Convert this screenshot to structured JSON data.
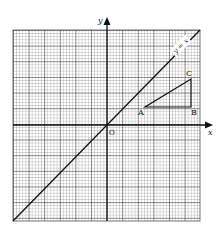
{
  "figure": {
    "axes": {
      "x_label": "x",
      "y_label": "y",
      "origin_label": "O"
    },
    "line": {
      "label": "y = x"
    },
    "triangle": {
      "points": [
        {
          "label": "A",
          "x": 4,
          "y": 2
        },
        {
          "label": "B",
          "x": 9,
          "y": 2
        },
        {
          "label": "C",
          "x": 9,
          "y": 5
        }
      ]
    },
    "grid": {
      "cols": 60,
      "rows": 61,
      "major_every": 5
    }
  }
}
